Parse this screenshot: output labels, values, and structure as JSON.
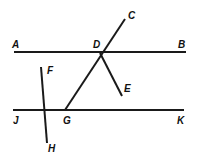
{
  "figure": {
    "type": "geometry-diagram",
    "background_color": "#ffffff",
    "stroke_color": "#1a1a1a",
    "stroke_width": 2,
    "label_color": "#111111",
    "canvas": {
      "width": 198,
      "height": 162
    }
  },
  "points": [
    {
      "id": "A",
      "label": "A",
      "x": 14,
      "y": 52,
      "label_x": 12,
      "label_y": 48
    },
    {
      "id": "B",
      "label": "B",
      "x": 186,
      "y": 52,
      "label_x": 178,
      "label_y": 48
    },
    {
      "id": "C",
      "label": "C",
      "x": 125,
      "y": 19,
      "label_x": 128,
      "label_y": 19
    },
    {
      "id": "D",
      "label": "D",
      "x": 100,
      "y": 53,
      "label_x": 93,
      "label_y": 48
    },
    {
      "id": "E",
      "label": "E",
      "x": 122,
      "y": 96,
      "label_x": 124,
      "label_y": 92
    },
    {
      "id": "F",
      "label": "F",
      "x": 41,
      "y": 67,
      "label_x": 47,
      "label_y": 74
    },
    {
      "id": "G",
      "label": "G",
      "x": 65,
      "y": 110,
      "label_x": 63,
      "label_y": 124
    },
    {
      "id": "H",
      "label": "H",
      "x": 47,
      "y": 143,
      "label_x": 48,
      "label_y": 152
    },
    {
      "id": "J",
      "label": "J",
      "x": 13,
      "y": 110,
      "label_x": 13,
      "label_y": 124
    },
    {
      "id": "K",
      "label": "K",
      "x": 184,
      "y": 110,
      "label_x": 177,
      "label_y": 124
    }
  ],
  "segments": [
    {
      "id": "AB",
      "name": "line-ab",
      "from": "A",
      "to": "B",
      "x1": 14,
      "y1": 52,
      "x2": 186,
      "y2": 52
    },
    {
      "id": "JK",
      "name": "line-jk",
      "from": "J",
      "to": "K",
      "x1": 13,
      "y1": 110,
      "x2": 184,
      "y2": 110
    },
    {
      "id": "CG",
      "name": "line-cg",
      "from": "C",
      "to": "G",
      "x1": 125,
      "y1": 19,
      "x2": 65,
      "y2": 110
    },
    {
      "id": "DE",
      "name": "line-de",
      "from": "D",
      "to": "E",
      "x1": 100,
      "y1": 53,
      "x2": 122,
      "y2": 96
    },
    {
      "id": "FH",
      "name": "line-fh",
      "from": "F",
      "to": "H",
      "x1": 41,
      "y1": 67,
      "x2": 47,
      "y2": 143
    }
  ],
  "relations": {
    "parallel_lines": [
      "AB",
      "JK"
    ],
    "intersection_points": [
      "D",
      "G"
    ]
  }
}
